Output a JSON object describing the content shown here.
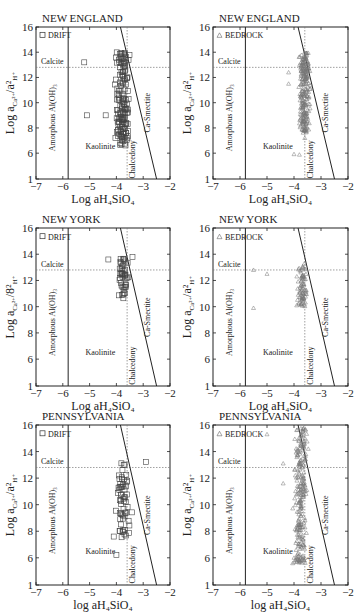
{
  "chart_data": [
    {
      "type": "scatter",
      "title": "NEW ENGLAND",
      "legend": "DRIFT",
      "marker": "square",
      "xlabel": "Log aH4SiO4",
      "ylabel": "Log aCa2+/a2H+",
      "xlim": [
        -7,
        -2
      ],
      "ylim": [
        1,
        16
      ],
      "xticks": [
        -7,
        -6,
        -5,
        -4,
        -3,
        -2
      ],
      "yticks": [
        1,
        6,
        8,
        10,
        12,
        14,
        16
      ],
      "fields": [
        "Calcite",
        "Amorphous Al(OH)3",
        "Kaolinite",
        "Chalcedony",
        "Ca-Smectite"
      ],
      "reference_lines": {
        "calcite_y": 12.8,
        "amorphous_x": -5.8,
        "chalcedony_x": -3.6,
        "smectite_line": [
          [
            -3.85,
            16
          ],
          [
            -2.5,
            1
          ]
        ]
      },
      "points_summary": "~150 points clustered x -4.3 to -3.2, y 6.5 to 14; outliers at (-5.2,13.2), (-5.1,9.0)"
    },
    {
      "type": "scatter",
      "title": "NEW ENGLAND",
      "legend": "BEDROCK",
      "marker": "triangle",
      "xlabel": "Log aH4SiO4",
      "ylabel": "Log aCa2+/a2H+",
      "xlim": [
        -7,
        -2
      ],
      "ylim": [
        1,
        16
      ],
      "xticks": [
        -7,
        -6,
        -5,
        -4,
        -3,
        -2
      ],
      "yticks": [
        1,
        6,
        8,
        10,
        12,
        14,
        16
      ],
      "fields": [
        "Calcite",
        "Amorphous Al(OH)3",
        "Kaolinite",
        "Chalcedony",
        "Ca-Smectite"
      ],
      "points_summary": "~250 points clustered x -4.0 to -3.2, y 7.5 to 14; outliers near (-4.2,11.5), (-4.0,5.8), (-3.8,5.7)"
    },
    {
      "type": "scatter",
      "title": "NEW YORK",
      "legend": "DRIFT",
      "marker": "square",
      "xlabel": "Log aH4SiO4",
      "ylabel": "Log aCa2+/8²H+",
      "xlim": [
        -7,
        -2
      ],
      "ylim": [
        1,
        16
      ],
      "xticks": [
        -7,
        -6,
        -5,
        -4,
        -3,
        -2
      ],
      "yticks": [
        1,
        6,
        8,
        10,
        12,
        14,
        16
      ],
      "fields": [
        "Calcite",
        "Amorphous Al(OH)3",
        "Kaolinite",
        "Chalcedony",
        "Ca-Smectite"
      ],
      "points_summary": "~45 points x -4.1 to -3.4, y 10.5 to 13.8; outlier (-4.3,13.6)"
    },
    {
      "type": "scatter",
      "title": "NEW YORK",
      "legend": "BEDROCK",
      "marker": "triangle",
      "xlabel": "Log aH4SiO4",
      "ylabel": "Log aCa2+/a2H+",
      "xlim": [
        -7,
        -2
      ],
      "ylim": [
        1,
        16
      ],
      "xticks": [
        -7,
        -6,
        -5,
        -4,
        -3,
        -2
      ],
      "yticks": [
        1,
        6,
        8,
        10,
        12,
        14,
        16
      ],
      "fields": [
        "Calcite",
        "Amorphous Al(OH)3",
        "Kaolinite",
        "Chalcedony",
        "Ca-Smectite"
      ],
      "points_summary": "~80 points x -4.0 to -3.4, y 10 to 13.5; outliers (-5.5,12.8), (-5.0,12.5), (-5.5,9.9)"
    },
    {
      "type": "scatter",
      "title": "PENNSYLVANIA",
      "legend": "DRIFT",
      "marker": "square",
      "xlabel": "log aH4SiO4",
      "ylabel": "Log aCa2+/a2H+",
      "xlim": [
        -7,
        -2
      ],
      "ylim": [
        1,
        16
      ],
      "xticks": [
        -7,
        -6,
        -5,
        -4,
        -3,
        -2
      ],
      "yticks": [
        1,
        6,
        8,
        10,
        12,
        14,
        16
      ],
      "fields": [
        "Calcite",
        "Amorphous Al(OH)3",
        "Kaolinite",
        "Chalcedony",
        "Ca-Smectite"
      ],
      "points_summary": "~60 points x -4.2 to -3.3, y 7.5 to 13.2; outliers (-2.9,13.2), (-4.0,6.2)"
    },
    {
      "type": "scatter",
      "title": "PENNSYLVANIA",
      "legend": "BEDROCK",
      "marker": "triangle",
      "xlabel": "log aH4SiO4",
      "ylabel": "Log aCa2+/a2H+",
      "xlim": [
        -7,
        -2
      ],
      "ylim": [
        1,
        16
      ],
      "xticks": [
        -7,
        -6,
        -5,
        -4,
        -3,
        -2
      ],
      "yticks": [
        1,
        6,
        8,
        10,
        12,
        14,
        16
      ],
      "fields": [
        "Calcite",
        "Amorphous Al(OH)3",
        "Kaolinite",
        "Chalcedony",
        "Ca-Smectite"
      ],
      "points_summary": "~250 points x -4.3 to -3.3, y 5 to 15.8; outliers (-5.0,15.3), (-4.4,13.1), (-4.4,11.6)"
    }
  ],
  "labels": {
    "calcite": "Calcite",
    "amorphous": "Amorphous Al(OH)₃",
    "kaolinite": "Kaolinite",
    "chalcedony": "Chalcedony",
    "smectite": "Ca-Smectite"
  }
}
